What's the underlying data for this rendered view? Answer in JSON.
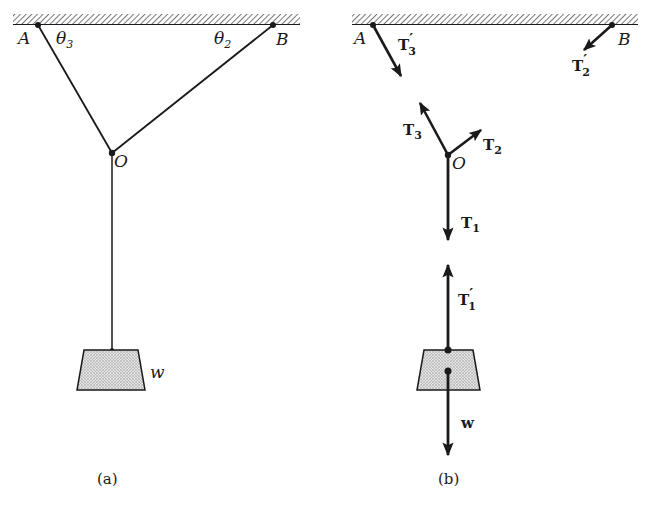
{
  "figure": {
    "panel_a": {
      "caption": "(a)",
      "points": {
        "A": "A",
        "B": "B",
        "O": "O"
      },
      "angles": {
        "theta3": "θ",
        "theta3_sub": "3",
        "theta2": "θ",
        "theta2_sub": "2"
      },
      "weight_label": "w"
    },
    "panel_b": {
      "caption": "(b)",
      "points": {
        "A": "A",
        "B": "B",
        "O": "O"
      },
      "vectors": {
        "T3_prime": {
          "base": "T",
          "sub": "3",
          "prime": "′"
        },
        "T2_prime": {
          "base": "T",
          "sub": "2",
          "prime": "′"
        },
        "T3": {
          "base": "T",
          "sub": "3"
        },
        "T2": {
          "base": "T",
          "sub": "2"
        },
        "T1": {
          "base": "T",
          "sub": "1"
        },
        "T1_prime": {
          "base": "T",
          "sub": "1",
          "prime": "′"
        },
        "w": {
          "base": "w"
        }
      }
    },
    "colors": {
      "ink": "#1a1a1a",
      "hatch": "#555555",
      "weight_fill": "#cfcfcf"
    }
  }
}
